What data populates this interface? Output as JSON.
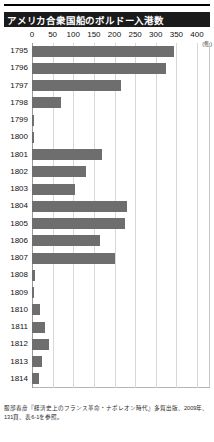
{
  "figure": {
    "title": "アメリカ合衆国船のボルドー入港数",
    "unit_label": "(隻)",
    "source_note": "服部春彦『経済史上のフランス革命・ナポレオン時代』多賀出版、2009年、131頁、表6-1を参照。"
  },
  "chart_data": {
    "type": "bar",
    "orientation": "horizontal",
    "title": "アメリカ合衆国船のボルドー入港数",
    "xlabel": "(隻)",
    "ylabel": "",
    "xlim": [
      0,
      400
    ],
    "xticks": [
      0,
      50,
      100,
      150,
      200,
      250,
      300,
      350,
      400
    ],
    "grid": true,
    "legend": false,
    "bar_color": "#6e6e6e",
    "categories": [
      "1795",
      "1796",
      "1797",
      "1798",
      "1799",
      "1800",
      "1801",
      "1802",
      "1803",
      "1804",
      "1805",
      "1806",
      "1807",
      "1808",
      "1809",
      "1810",
      "1811",
      "1812",
      "1813",
      "1814"
    ],
    "values": [
      345,
      325,
      215,
      70,
      5,
      5,
      170,
      130,
      105,
      230,
      225,
      165,
      200,
      8,
      4,
      20,
      32,
      40,
      25,
      18
    ]
  }
}
